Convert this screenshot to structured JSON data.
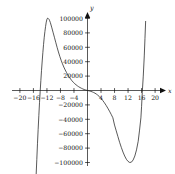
{
  "chart_data": {
    "type": "line",
    "title": "",
    "subtitle": "",
    "xlabel": "x",
    "ylabel": "y",
    "xlim": [
      -22,
      22
    ],
    "ylim": [
      -112000,
      112000
    ],
    "grid": false,
    "legend": null,
    "x_ticks": [
      -20,
      -16,
      -12,
      -8,
      -4,
      4,
      8,
      12,
      16,
      20
    ],
    "x_tick_labels": [
      "−20",
      "−16",
      "−12",
      "−8",
      "−4",
      "4",
      "8",
      "12",
      "16",
      "20"
    ],
    "y_ticks": [
      -100000,
      -80000,
      -60000,
      -40000,
      -20000,
      20000,
      40000,
      60000,
      80000,
      100000
    ],
    "y_tick_labels": [
      "−100000",
      "−80000",
      "−60000",
      "−40000",
      "−20000",
      "20000",
      "40000",
      "60000",
      "80000",
      "100000"
    ],
    "series": [
      {
        "name": "polynomial",
        "color": "#222222",
        "x": [
          -15.2,
          -15.0,
          -14.8,
          -14.6,
          -14.4,
          -14.2,
          -14.0,
          -13.8,
          -13.6,
          -13.4,
          -13.2,
          -13.0,
          -12.8,
          -12.6,
          -12.4,
          -12.2,
          -12.0,
          -11.8,
          -11.6,
          -11.4,
          -11.2,
          -11.0,
          -10.6,
          -10.2,
          -9.8,
          -9.4,
          -9.0,
          -8.6,
          -8.2,
          -7.8,
          -7.4,
          -7.0,
          -6.6,
          -6.2,
          -5.8,
          -5.4,
          -5.0,
          -4.6,
          -4.2,
          -3.8,
          -3.4,
          -3.0,
          -2.6,
          -2.2,
          -1.8,
          -1.4,
          -1.0,
          -0.6,
          -0.2,
          0.2,
          0.6,
          1.0,
          1.4,
          1.8,
          2.2,
          2.6,
          3.0,
          3.5,
          4.0,
          4.5,
          5.0,
          5.5,
          6.0,
          6.5,
          7.0,
          7.5,
          8.0,
          8.5,
          9.0,
          9.5,
          10.0,
          10.5,
          11.0,
          11.5,
          12.0,
          12.5,
          13.0,
          13.5,
          14.0,
          14.5,
          15.0,
          15.4,
          15.8,
          16.0,
          16.2,
          16.5,
          16.8,
          17.0,
          17.2
        ],
        "y": [
          -118000,
          -96000,
          -74000,
          -54000,
          -35000,
          -17000,
          -1000,
          14000,
          28000,
          41000,
          53000,
          64000,
          74000,
          82000,
          89000,
          95000,
          99000,
          100500,
          100000,
          99000,
          97000,
          94500,
          88000,
          81000,
          74000,
          67000,
          60000,
          53500,
          47500,
          42000,
          37000,
          32500,
          28500,
          25000,
          21500,
          18500,
          16000,
          13500,
          11500,
          9500,
          8000,
          6500,
          5200,
          4100,
          3100,
          2200,
          1400,
          800,
          250,
          -200,
          -700,
          -1200,
          -1900,
          -2700,
          -3700,
          -4900,
          -6300,
          -8400,
          -10900,
          -13800,
          -17000,
          -20600,
          -24500,
          -28700,
          -33100,
          -37800,
          -48000,
          -56000,
          -64000,
          -72000,
          -79000,
          -85500,
          -91000,
          -95500,
          -98500,
          -100000,
          -99500,
          -96500,
          -91000,
          -82500,
          -70500,
          -55000,
          -38000,
          -22000,
          -3000,
          20000,
          48000,
          72000,
          96000
        ]
      }
    ],
    "annotations": []
  },
  "axes": {
    "x_axis_name": "x",
    "y_axis_name": "y"
  }
}
